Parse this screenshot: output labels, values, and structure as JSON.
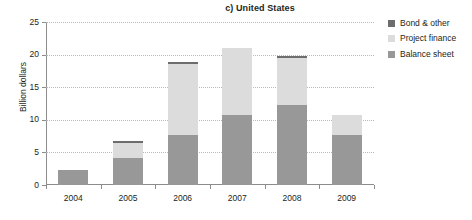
{
  "chart_data": {
    "type": "bar",
    "stacked": true,
    "title": "c) United States",
    "xlabel": "",
    "ylabel": "Billion dollars",
    "categories": [
      "2004",
      "2005",
      "2006",
      "2007",
      "2008",
      "2009"
    ],
    "ylim": [
      0,
      25
    ],
    "yticks": [
      0,
      5,
      10,
      15,
      20,
      25
    ],
    "ytick_labels": [
      "0",
      "5",
      "10",
      "15",
      "20",
      "25"
    ],
    "grid": "horizontal-dotted",
    "legend_position": "right",
    "series": [
      {
        "name": "Balance sheet",
        "color": "#989898",
        "values": [
          2.3,
          4.1,
          7.6,
          10.8,
          12.2,
          7.7
        ]
      },
      {
        "name": "Project finance",
        "color": "#dcdcdc",
        "values": [
          0.0,
          2.3,
          11.0,
          10.2,
          7.3,
          3.1
        ]
      },
      {
        "name": "Bond & other",
        "color": "#6d6d6d",
        "values": [
          0.0,
          0.3,
          0.2,
          0.0,
          0.3,
          0.0
        ]
      }
    ],
    "totals": [
      2.3,
      6.7,
      18.8,
      21.0,
      19.8,
      10.8
    ]
  },
  "legend": {
    "items": [
      {
        "label": "Bond & other",
        "color": "#6d6d6d"
      },
      {
        "label": "Project finance",
        "color": "#dcdcdc"
      },
      {
        "label": "Balance sheet",
        "color": "#989898"
      }
    ]
  },
  "colors": {
    "axis": "#8c8c8c",
    "grid": "#b9b9b9",
    "text": "#231f20",
    "background": "#ffffff"
  }
}
